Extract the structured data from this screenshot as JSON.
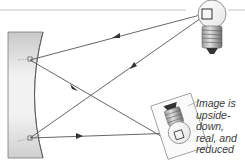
{
  "diagram": {
    "caption": {
      "lines": [
        "Image is",
        "upside-",
        "down,",
        "real, and",
        "reduced"
      ]
    },
    "elements": {
      "principal_axis": "horizontal line",
      "mirror": "concave mirror",
      "object": "upright light bulb",
      "image": "inverted light bulb (real image)"
    },
    "colors": {
      "ray": "#555555",
      "axis": "#bdbdbd",
      "mirror_fill": "#d9d9d9",
      "mirror_edge": "#6e6e6e",
      "text": "#3a3a3a"
    }
  }
}
